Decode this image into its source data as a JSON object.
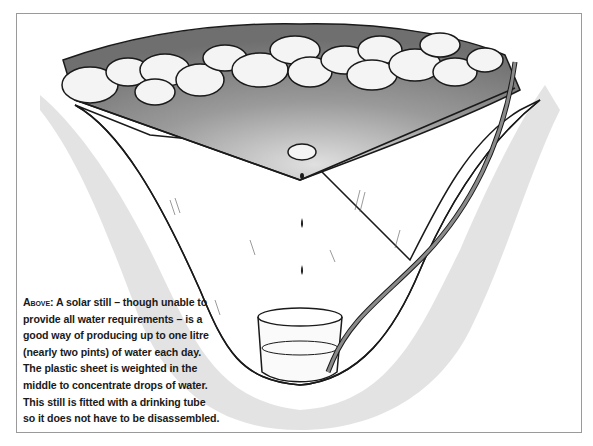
{
  "figure": {
    "type": "illustration",
    "subject": "solar still",
    "elements": [
      "plastic sheet",
      "stones",
      "weight stone",
      "water drops",
      "collection container",
      "drinking tube",
      "pit in soil"
    ]
  },
  "caption": {
    "lead": "Above:",
    "lines": [
      "A solar still – though unable to",
      "provide all water requirements – is a",
      "good way of producing up to one litre",
      "(nearly two pints) of water each day.",
      "The plastic sheet is weighted in the",
      "middle to concentrate drops of water.",
      "This still is fitted with a drinking tube",
      "so it does not have to be disassembled."
    ]
  },
  "colors": {
    "sheet": "#8a8a8a",
    "stone": "#f2f2f2",
    "soil": "#d8d8d8",
    "ink": "#1a1a1a",
    "border": "#9a9a9a"
  }
}
